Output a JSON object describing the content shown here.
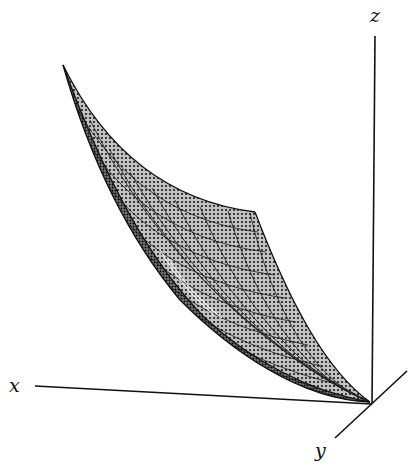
{
  "figure": {
    "type": "3d-surface",
    "axes": {
      "x_label": "x",
      "y_label": "y",
      "z_label": "z"
    },
    "colors": {
      "background": "#ffffff",
      "ink": "#111111",
      "surface_fill": "#bdbdbd",
      "surface_dots": "#1a1a1a"
    }
  }
}
